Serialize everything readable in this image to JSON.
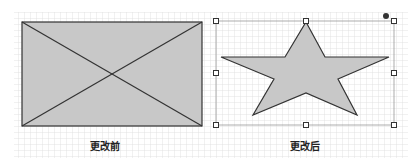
{
  "panels": [
    {
      "id": "before",
      "caption": "更改前",
      "shape": "rectangle-with-crossed-diagonals",
      "fill": "#c8c8c8",
      "stroke": "#333333"
    },
    {
      "id": "after",
      "caption": "更改后",
      "shape": "five-point-star",
      "fill": "#c8c8c8",
      "stroke": "#333333",
      "selected": true,
      "handles": 8,
      "rotation_handle": true
    }
  ],
  "grid": {
    "color": "#d9d9d9",
    "spacing": 6
  }
}
